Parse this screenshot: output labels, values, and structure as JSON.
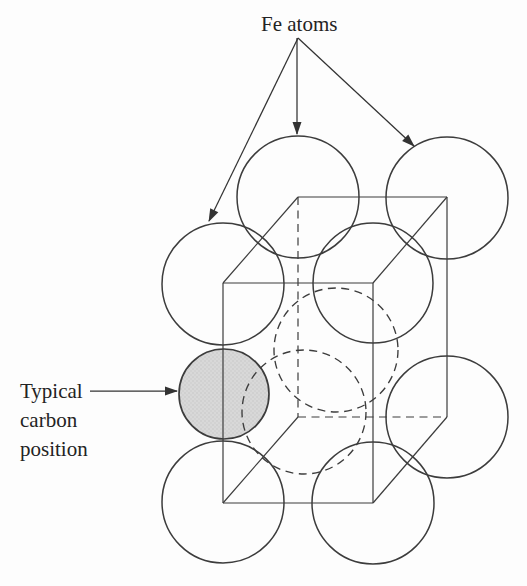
{
  "diagram": {
    "canvas": {
      "width": 527,
      "height": 586,
      "background": "#fdfdfd"
    },
    "colors": {
      "stroke": "#3c3c3c",
      "arrow": "#333333",
      "text": "#232323",
      "carbon_fill": "#d8d8d8",
      "carbon_speckle": "#c2c2c2"
    },
    "labels": {
      "fe_atoms": "Fe atoms",
      "carbon_position_lines": [
        "Typical",
        "carbon",
        "position"
      ]
    },
    "unit_cell": {
      "solid_edges": [
        {
          "x1": 223,
          "y1": 283,
          "x2": 373,
          "y2": 283
        },
        {
          "x1": 223,
          "y1": 503,
          "x2": 373,
          "y2": 503
        },
        {
          "x1": 223,
          "y1": 283,
          "x2": 223,
          "y2": 503
        },
        {
          "x1": 373,
          "y1": 283,
          "x2": 373,
          "y2": 503
        },
        {
          "x1": 223,
          "y1": 283,
          "x2": 298,
          "y2": 197
        },
        {
          "x1": 373,
          "y1": 283,
          "x2": 447,
          "y2": 197
        },
        {
          "x1": 298,
          "y1": 197,
          "x2": 447,
          "y2": 197
        },
        {
          "x1": 447,
          "y1": 197,
          "x2": 447,
          "y2": 417
        },
        {
          "x1": 223,
          "y1": 503,
          "x2": 298,
          "y2": 417
        },
        {
          "x1": 373,
          "y1": 503,
          "x2": 447,
          "y2": 417
        }
      ],
      "hidden_edges": [
        {
          "x1": 298,
          "y1": 197,
          "x2": 298,
          "y2": 417
        },
        {
          "x1": 298,
          "y1": 417,
          "x2": 447,
          "y2": 417
        }
      ]
    },
    "fe_atoms_visible": [
      {
        "cx": 298,
        "cy": 197,
        "r": 61
      },
      {
        "cx": 447,
        "cy": 198,
        "r": 61
      },
      {
        "cx": 223,
        "cy": 284,
        "r": 61
      },
      {
        "cx": 373,
        "cy": 283,
        "r": 60
      },
      {
        "cx": 447,
        "cy": 417,
        "r": 61
      },
      {
        "cx": 223,
        "cy": 502,
        "r": 61
      },
      {
        "cx": 373,
        "cy": 503,
        "r": 61
      }
    ],
    "fe_atoms_hidden": [
      {
        "cx": 336,
        "cy": 350,
        "r": 62
      },
      {
        "cx": 304,
        "cy": 412,
        "r": 62
      }
    ],
    "carbon_atom": {
      "cx": 224,
      "cy": 394,
      "r": 45
    },
    "annotation_arrows": [
      {
        "x1": 298,
        "y1": 38,
        "x2": 209,
        "y2": 221
      },
      {
        "x1": 297,
        "y1": 38,
        "x2": 297,
        "y2": 134
      },
      {
        "x1": 298,
        "y1": 38,
        "x2": 414,
        "y2": 146
      },
      {
        "x1": 90,
        "y1": 391,
        "x2": 177,
        "y2": 391
      }
    ]
  }
}
